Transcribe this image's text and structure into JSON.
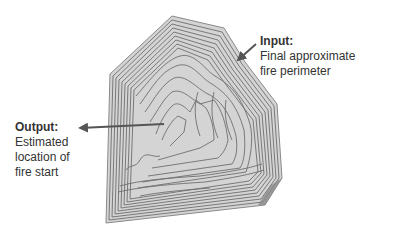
{
  "input": {
    "title": "Input:",
    "lines": [
      "Final approximate",
      "fire perimeter"
    ]
  },
  "output": {
    "title": "Output:",
    "lines": [
      "Estimated",
      "location of",
      "fire start"
    ]
  },
  "colors": {
    "fill": "#d4d4d4",
    "contour": "#6e6e6e",
    "arrow": "#555555",
    "text": "#333333"
  }
}
